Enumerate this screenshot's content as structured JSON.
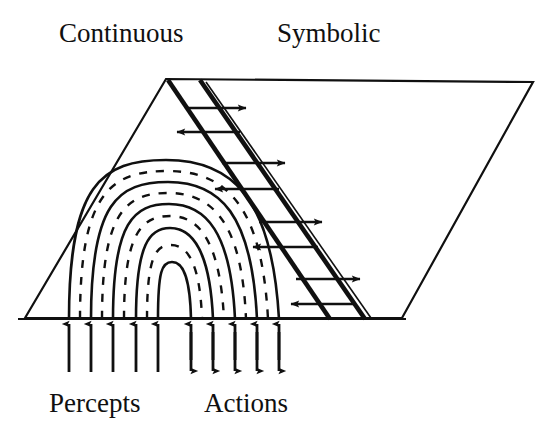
{
  "figure": {
    "background_color": "#ffffff",
    "stroke_color": "#101010",
    "width": 549,
    "height": 444
  },
  "labels": {
    "top_left": "Continuous",
    "top_right": "Symbolic",
    "bottom_left": "Percepts",
    "bottom_right": "Actions"
  },
  "regions": {
    "continuous_region": {
      "name": "Continuous",
      "description": "Nested arcs region on the left of the slab",
      "solid_arc_count": 5,
      "dashed_arc_count": 4
    },
    "symbolic_region": {
      "name": "Symbolic",
      "description": "Open right side of the parallelogram slab"
    },
    "interface_band": {
      "name": "ladder-band",
      "description": "Diagonal double-line band separating continuous and symbolic regions",
      "rung_pair_count": 4,
      "rung_direction_upper": "right",
      "rung_direction_lower": "left"
    }
  },
  "flows": {
    "percepts": {
      "label": "Percepts",
      "arrow_count": 5,
      "direction": "up",
      "double_headed": false
    },
    "actions": {
      "label": "Actions",
      "arrow_count": 5,
      "direction": "up-down",
      "double_headed": true
    }
  },
  "geometry": {
    "slab_apex": [
      166,
      79
    ],
    "slab_top_right": [
      533,
      82
    ],
    "slab_bottom_right": [
      402,
      318
    ],
    "slab_bottom_left": [
      25,
      318
    ],
    "baseline_y": 318
  }
}
